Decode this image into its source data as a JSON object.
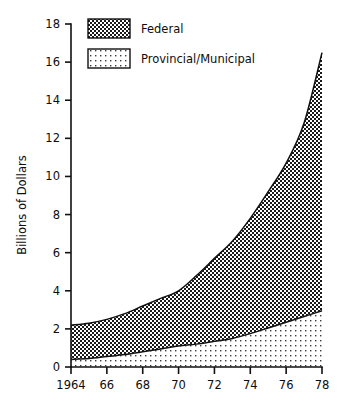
{
  "chart_data": {
    "type": "area",
    "title": "",
    "subtitle": "",
    "xlabel": "",
    "ylabel": "Billions of Dollars",
    "xlim": [
      1964,
      1978
    ],
    "ylim": [
      0,
      18
    ],
    "grid": false,
    "stacked": true,
    "legend_position": "top-left-inside",
    "x": [
      1964,
      1965,
      1966,
      1967,
      1968,
      1969,
      1970,
      1971,
      1972,
      1973,
      1974,
      1975,
      1976,
      1977,
      1978
    ],
    "xticks": [
      1964,
      1966,
      1968,
      1970,
      1972,
      1974,
      1976,
      1978
    ],
    "xtick_labels": [
      "1964",
      "66",
      "68",
      "70",
      "72",
      "74",
      "76",
      "78"
    ],
    "yticks": [
      0,
      2,
      4,
      6,
      8,
      10,
      12,
      14,
      16,
      18
    ],
    "ytick_labels": [
      "0",
      "2",
      "4",
      "6",
      "8",
      "10",
      "12",
      "14",
      "16",
      "18"
    ],
    "series": [
      {
        "name": "Provincial/Municipal",
        "pattern": "sparse-dots",
        "values": [
          0.4,
          0.45,
          0.55,
          0.65,
          0.8,
          0.95,
          1.1,
          1.2,
          1.35,
          1.5,
          1.75,
          2.05,
          2.35,
          2.65,
          2.95
        ]
      },
      {
        "name": "Federal",
        "pattern": "dense-checker",
        "values": [
          1.8,
          1.85,
          1.95,
          2.15,
          2.4,
          2.65,
          2.9,
          3.6,
          4.35,
          5.1,
          6.05,
          7.15,
          8.35,
          10.15,
          13.55
        ]
      }
    ],
    "cumulative_total": [
      2.2,
      2.3,
      2.5,
      2.8,
      3.2,
      3.6,
      4.0,
      4.8,
      5.7,
      6.6,
      7.8,
      9.2,
      10.7,
      12.8,
      16.5
    ],
    "legend": [
      {
        "label": "Federal",
        "pattern": "dense-checker"
      },
      {
        "label": "Provincial/Municipal",
        "pattern": "sparse-dots"
      }
    ],
    "colors": {
      "axis": "#111111",
      "outline": "#111111",
      "background": "#ffffff",
      "federal_fill": "#3f3f3f",
      "provincial_fill": "#b8b8b8"
    }
  }
}
